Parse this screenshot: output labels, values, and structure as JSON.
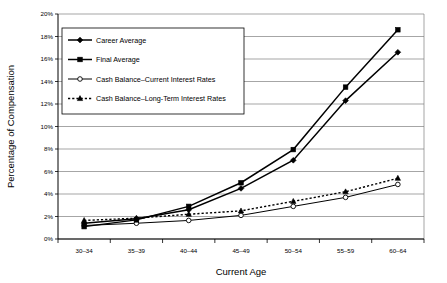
{
  "chart_data": {
    "type": "line",
    "title": "",
    "xlabel": "Current Age",
    "ylabel": "Percentage of Compensation",
    "categories": [
      "30–34",
      "35–39",
      "40–44",
      "45–49",
      "50–54",
      "55–59",
      "60–64"
    ],
    "ylim": [
      0,
      20
    ],
    "ytick_labels": [
      "0%",
      "2%",
      "4%",
      "6%",
      "8%",
      "10%",
      "12%",
      "14%",
      "16%",
      "18%",
      "20%"
    ],
    "ytick_values": [
      0,
      2,
      4,
      6,
      8,
      10,
      12,
      14,
      16,
      18,
      20
    ],
    "grid": true,
    "legend_position": "upper-left-inside",
    "series": [
      {
        "name": "Career Average",
        "marker": "diamond",
        "line": "solid",
        "values": [
          1.4,
          1.8,
          2.6,
          4.5,
          7.0,
          12.3,
          16.6
        ]
      },
      {
        "name": "Final Average",
        "marker": "square",
        "line": "solid",
        "values": [
          1.1,
          1.7,
          2.9,
          5.0,
          7.95,
          13.5,
          18.6
        ]
      },
      {
        "name": "Cash Balance–Current Interest Rates",
        "marker": "open-circle",
        "line": "solid",
        "values": [
          1.2,
          1.4,
          1.65,
          2.1,
          2.9,
          3.7,
          4.85
        ]
      },
      {
        "name": "Cash Balance–Long-Term Interest Rates",
        "marker": "triangle",
        "line": "dotted",
        "values": [
          1.65,
          1.85,
          2.2,
          2.5,
          3.35,
          4.2,
          5.4
        ]
      }
    ]
  },
  "colors": {
    "series_line": "#000000",
    "gridline": "#808080",
    "axis": "#000000",
    "background": "#ffffff"
  },
  "footer": {
    "cut_text": " "
  }
}
